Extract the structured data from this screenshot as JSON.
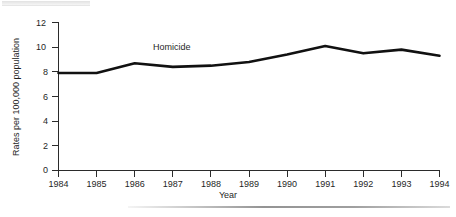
{
  "chart_data": {
    "type": "line",
    "title": "",
    "subtitle": "",
    "xlabel": "Year",
    "ylabel": "Rates per 100,000 population",
    "x": [
      1984,
      1985,
      1986,
      1987,
      1988,
      1989,
      1990,
      1991,
      1992,
      1993,
      1994
    ],
    "xtick_labels": [
      "1984",
      "1985",
      "1986",
      "1987",
      "1988",
      "1989",
      "1990",
      "1991",
      "1992",
      "1993",
      "1994"
    ],
    "ytick_labels": [
      "0",
      "2",
      "4",
      "6",
      "8",
      "10",
      "12"
    ],
    "yticks": [
      0,
      2,
      4,
      6,
      8,
      10,
      12
    ],
    "ylim": [
      0,
      12
    ],
    "xlim": [
      1984,
      1994
    ],
    "grid": false,
    "legend_position": "inline-annotation",
    "series": [
      {
        "name": "Homicide",
        "color": "#111111",
        "values": [
          7.9,
          7.9,
          8.7,
          8.4,
          8.5,
          8.8,
          9.4,
          10.1,
          9.5,
          9.8,
          9.3
        ]
      }
    ],
    "annotations": [
      {
        "text": "Homicide",
        "x": 1986.5,
        "y": 9.5
      }
    ]
  },
  "axes": {
    "x_title": "Year",
    "y_title": "Rates per 100,000 population"
  },
  "series_label": "Homicide"
}
